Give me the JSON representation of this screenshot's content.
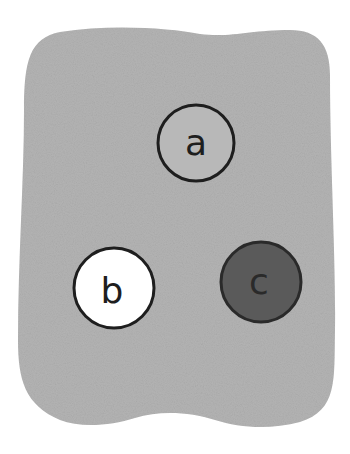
{
  "diagram": {
    "region": {
      "fill": "#b4b4b4"
    },
    "circles": [
      {
        "label": "a",
        "cx": 196,
        "cy": 143,
        "r": 38,
        "fill": "#b8b8b8",
        "stroke": "#1e1e1e",
        "text_color": "#1e1e1e"
      },
      {
        "label": "b",
        "cx": 114,
        "cy": 288,
        "r": 40,
        "fill": "#ffffff",
        "stroke": "#1e1e1e",
        "text_color": "#1e1e1e"
      },
      {
        "label": "c",
        "cx": 261,
        "cy": 282,
        "r": 40,
        "fill": "#5a5a5a",
        "stroke": "#2a2a2a",
        "text_color": "#2a2a2a"
      }
    ]
  }
}
